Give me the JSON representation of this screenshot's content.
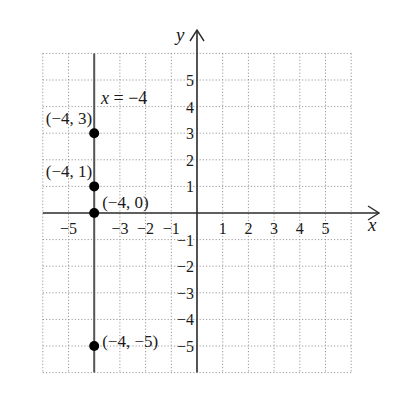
{
  "chart_data": {
    "type": "scatter",
    "title": "",
    "xlabel": "x",
    "ylabel": "y",
    "xlim": [
      -6,
      6
    ],
    "ylim": [
      -6,
      6
    ],
    "grid": true,
    "x_ticks": [
      -5,
      -3,
      -2,
      -1,
      1,
      2,
      3,
      4,
      5
    ],
    "x_tick_labels": [
      "−5",
      "−3",
      "−2",
      "−1",
      "1",
      "2",
      "3",
      "4",
      "5"
    ],
    "y_ticks": [
      5,
      4,
      3,
      2,
      1,
      -1,
      -2,
      -3,
      -4,
      -5
    ],
    "y_tick_labels": [
      "5",
      "4",
      "3",
      "2",
      "1",
      "−1",
      "−2",
      "−3",
      "−4",
      "−5"
    ],
    "line": {
      "equation": "x = −4",
      "x": -4
    },
    "points": [
      {
        "x": -4,
        "y": 3,
        "label": "(−4, 3)"
      },
      {
        "x": -4,
        "y": 1,
        "label": "(−4, 1)"
      },
      {
        "x": -4,
        "y": 0,
        "label": "(−4, 0)"
      },
      {
        "x": -4,
        "y": -5,
        "label": "(−4, −5)"
      }
    ]
  },
  "colors": {
    "grid": "#9a9a9a",
    "axis": "#2a2a2a",
    "line": "#555555",
    "point": "#000000"
  }
}
